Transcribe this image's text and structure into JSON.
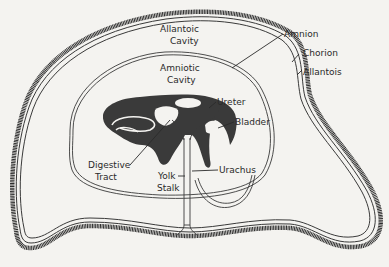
{
  "diagram": {
    "type": "biological-diagram",
    "labels": {
      "allantoic_cavity_1": "Allantoic",
      "allantoic_cavity_2": "Cavity",
      "amniotic_cavity_1": "Amniotic",
      "amniotic_cavity_2": "Cavity",
      "amnion": "Amnion",
      "chorion": "Chorion",
      "allantois": "Allantois",
      "ureter": "Ureter",
      "bladder": "Bladder",
      "digestive_tract_1": "Digestive",
      "digestive_tract_2": "Tract",
      "yolk_stalk_1": "Yolk",
      "yolk_stalk_2": "Stalk",
      "urachus": "Urachus"
    },
    "colors": {
      "background": "#f4f3f0",
      "ink": "#2a2a2a",
      "embryo_fill": "#3a3a3a"
    }
  }
}
